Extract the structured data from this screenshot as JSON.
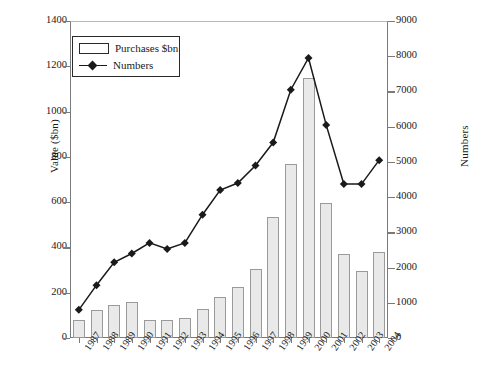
{
  "chart_data": {
    "type": "bar",
    "title": "",
    "subtitle": "",
    "xlabel": "",
    "ylabel": "Value ($bn)",
    "y2label": "Numbers",
    "ylim": [
      0,
      1400
    ],
    "y2lim": [
      0,
      9000
    ],
    "ytick_step": 200,
    "y2tick_step": 1000,
    "grid": false,
    "legend_position": "top-left",
    "categories": [
      "1987",
      "1988",
      "1989",
      "1990",
      "1991",
      "1992",
      "1993",
      "1994",
      "1995",
      "1996",
      "1997",
      "1998",
      "1999",
      "2000",
      "2001",
      "2002",
      "2003",
      "2004"
    ],
    "yticks": [
      "0",
      "200",
      "400",
      "600",
      "800",
      "1000",
      "1200",
      "1400"
    ],
    "y2ticks": [
      "0",
      "1000",
      "2000",
      "3000",
      "4000",
      "5000",
      "6000",
      "7000",
      "8000",
      "9000"
    ],
    "series": [
      {
        "name": "Purchases $bn",
        "type": "bar",
        "axis": "left",
        "fill": "#e9e9e9",
        "stroke": "#9a9a9a",
        "values": [
          80,
          125,
          145,
          160,
          80,
          78,
          88,
          130,
          180,
          225,
          305,
          535,
          770,
          1150,
          598,
          370,
          295,
          382
        ]
      },
      {
        "name": "Numbers",
        "type": "line",
        "axis": "right",
        "stroke": "#1a1a1a",
        "marker": "diamond",
        "values": [
          800,
          1500,
          2150,
          2400,
          2700,
          2530,
          2700,
          3500,
          4200,
          4400,
          4900,
          5550,
          7050,
          7950,
          6050,
          4370,
          4370,
          5050
        ]
      }
    ]
  },
  "legend": {
    "items": [
      {
        "label": "Purchases $bn",
        "swatch": "bar-outline-swatch"
      },
      {
        "label": "Numbers",
        "swatch": "line-diamond-swatch"
      }
    ]
  },
  "axes": {
    "left": {
      "title": "Value ($bn)"
    },
    "right": {
      "title": "Numbers"
    }
  }
}
